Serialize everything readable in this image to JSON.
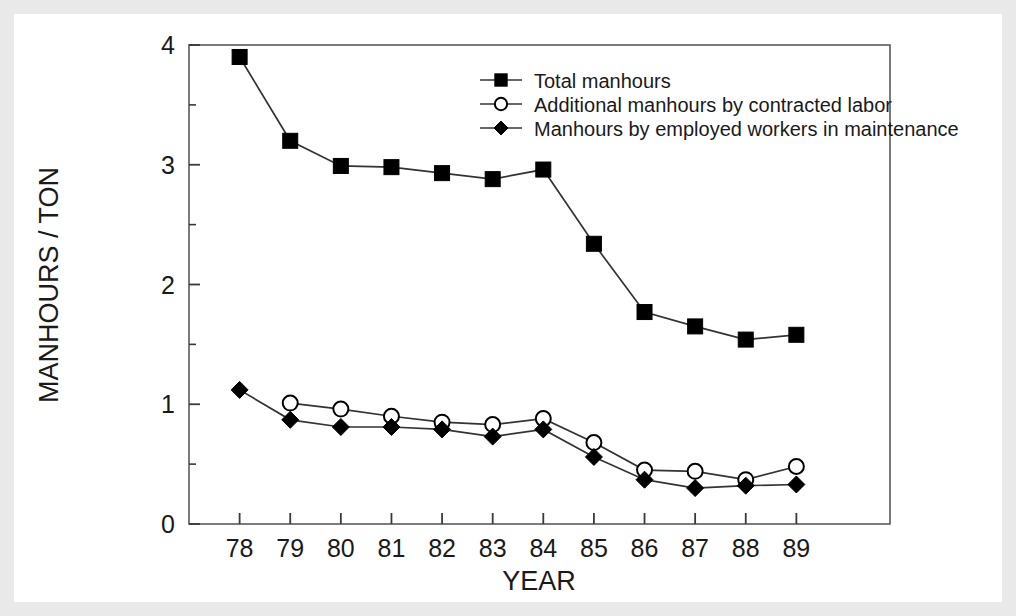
{
  "figure": {
    "frame_color": "#e9e9e9",
    "background": "#ffffff",
    "line_color": "#222222",
    "marker_color": "#000000"
  },
  "chart_data": {
    "type": "line",
    "title": "",
    "xlabel": "YEAR",
    "ylabel": "MANHOURS / TON",
    "x": [
      "78",
      "79",
      "80",
      "81",
      "82",
      "83",
      "84",
      "85",
      "86",
      "87",
      "88",
      "89"
    ],
    "categories": [
      "78",
      "79",
      "80",
      "81",
      "82",
      "83",
      "84",
      "85",
      "86",
      "87",
      "88",
      "89"
    ],
    "xlim": [
      77.5,
      89.7
    ],
    "ylim": [
      0,
      4
    ],
    "yticks": [
      0,
      1,
      2,
      3,
      4
    ],
    "yticklabels": [
      "0",
      "1",
      "2",
      "3",
      "4"
    ],
    "yminorticks": [
      0.5,
      1.5,
      2.5,
      3.5
    ],
    "grid": false,
    "legend_position": "upper center",
    "series": [
      {
        "name": "Total manhours",
        "marker": "filled-square",
        "values": [
          3.9,
          3.2,
          2.99,
          2.98,
          2.93,
          2.88,
          2.96,
          2.34,
          1.77,
          1.65,
          1.54,
          1.58
        ]
      },
      {
        "name": "Additional manhours by contracted labor",
        "marker": "open-circle",
        "values": [
          null,
          1.01,
          0.96,
          0.9,
          0.85,
          0.83,
          0.88,
          0.68,
          0.45,
          0.44,
          0.37,
          0.48
        ]
      },
      {
        "name": "Manhours by employed workers in maintenance",
        "marker": "filled-diamond",
        "values": [
          1.12,
          0.87,
          0.81,
          0.81,
          0.79,
          0.73,
          0.79,
          0.56,
          0.37,
          0.3,
          0.32,
          0.33
        ]
      }
    ]
  },
  "legend": {
    "items": [
      {
        "label": "Total manhours",
        "marker": "filled-square"
      },
      {
        "label": "Additional manhours by contracted labor",
        "marker": "open-circle"
      },
      {
        "label": "Manhours by employed workers in maintenance",
        "marker": "filled-diamond"
      }
    ]
  },
  "axes": {
    "y_title": "MANHOURS / TON",
    "x_title": "YEAR"
  }
}
